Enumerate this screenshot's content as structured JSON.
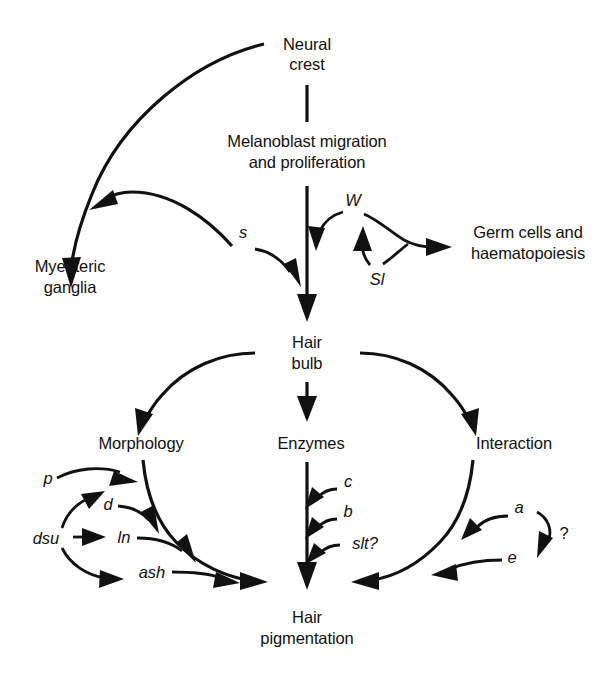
{
  "diagram": {
    "ink_color": "#111111",
    "background_color": "#ffffff",
    "nodes": [
      {
        "id": "neural_crest",
        "label_line1": "Neural",
        "label_line2": "crest"
      },
      {
        "id": "melanoblast",
        "label_line1": "Melanoblast migration",
        "label_line2": "and proliferation"
      },
      {
        "id": "myenteric_ganglia",
        "label_line1": "Myenteric",
        "label_line2": "ganglia"
      },
      {
        "id": "germ_cells",
        "label_line1": "Germ cells and",
        "label_line2": "haematopoiesis"
      },
      {
        "id": "hair_bulb",
        "label_line1": "Hair",
        "label_line2": "bulb"
      },
      {
        "id": "morphology",
        "label_line1": "Morphology",
        "label_line2": ""
      },
      {
        "id": "enzymes",
        "label_line1": "Enzymes",
        "label_line2": ""
      },
      {
        "id": "interaction",
        "label_line1": "Interaction",
        "label_line2": ""
      },
      {
        "id": "hair_pigmentation",
        "label_line1": "Hair",
        "label_line2": "pigmentation"
      }
    ],
    "gene_labels": [
      {
        "id": "gene_s",
        "text": "s"
      },
      {
        "id": "gene_w",
        "text": "W"
      },
      {
        "id": "gene_sl",
        "text": "Sl"
      },
      {
        "id": "gene_p",
        "text": "p"
      },
      {
        "id": "gene_d",
        "text": "d"
      },
      {
        "id": "gene_dsu",
        "text": "dsu"
      },
      {
        "id": "gene_ln",
        "text": "ln"
      },
      {
        "id": "gene_ash",
        "text": "ash"
      },
      {
        "id": "gene_c",
        "text": "c"
      },
      {
        "id": "gene_b",
        "text": "b"
      },
      {
        "id": "gene_slt",
        "text": "slt?"
      },
      {
        "id": "gene_a",
        "text": "a"
      },
      {
        "id": "gene_e",
        "text": "e"
      }
    ],
    "annotations": [
      {
        "id": "question_mark",
        "text": "?"
      }
    ]
  }
}
